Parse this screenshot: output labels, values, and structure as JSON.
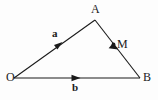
{
  "figure": {
    "kind": "vector-triangle-diagram",
    "background_color": "#fdfdfd",
    "stroke_color": "#1a1a1a",
    "label_color": "#1a1a1a",
    "width": 158,
    "height": 100
  },
  "points": {
    "O": {
      "label": "O",
      "x": 14,
      "y": 78
    },
    "A": {
      "label": "A",
      "x": 95,
      "y": 20
    },
    "B": {
      "label": "B",
      "x": 140,
      "y": 78
    },
    "M": {
      "label": "M",
      "x": 114,
      "y": 45
    }
  },
  "vectors": {
    "a": {
      "label": "a",
      "from": "O",
      "to": "A"
    },
    "b": {
      "label": "b",
      "from": "O",
      "to": "B"
    }
  },
  "segments": {
    "AB": {
      "label": "",
      "from": "A",
      "to": "B"
    }
  }
}
